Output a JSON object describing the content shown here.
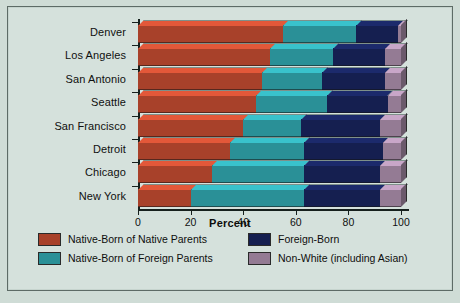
{
  "chart_data": {
    "type": "bar",
    "orientation": "horizontal",
    "stacked": true,
    "title": "",
    "xlabel": "Percent",
    "ylabel": "",
    "xlim": [
      0,
      100
    ],
    "xticks": [
      0,
      20,
      40,
      60,
      80,
      100
    ],
    "xtick_labels": [
      "0",
      "20",
      "40",
      "60",
      "80",
      "100"
    ],
    "grid": false,
    "legend_position": "bottom",
    "categories": [
      "Denver",
      "Los Angeles",
      "San Antonio",
      "Seattle",
      "San Francisco",
      "Detroit",
      "Chicago",
      "New York"
    ],
    "series": [
      {
        "name": "Native-Born of Native Parents",
        "color": "#a8412a",
        "values": [
          55,
          50,
          47,
          45,
          40,
          35,
          28,
          20
        ]
      },
      {
        "name": "Native-Born of Foreign Parents",
        "color": "#2a9097",
        "values": [
          28,
          24,
          23,
          27,
          22,
          28,
          35,
          43
        ]
      },
      {
        "name": "Foreign-Born",
        "color": "#151f50",
        "values": [
          16,
          20,
          24,
          23,
          30,
          30,
          29,
          29
        ]
      },
      {
        "name": "Non-White (including Asian)",
        "color": "#947b94",
        "values": [
          1,
          6,
          6,
          5,
          8,
          7,
          8,
          8
        ]
      }
    ]
  },
  "legend": {
    "items": [
      {
        "label": "Native-Born of Native Parents",
        "color": "#a8412a"
      },
      {
        "label": "Foreign-Born",
        "color": "#151f50"
      },
      {
        "label": "Native-Born of Foreign Parents",
        "color": "#2a9097"
      },
      {
        "label": "Non-White (including Asian)",
        "color": "#947b94"
      }
    ]
  },
  "axis": {
    "x_title": "Percent"
  },
  "caption": {
    "text": ""
  },
  "colors": {
    "panel_background": "#d5e1dc",
    "page_background": "#cfdcd6",
    "border": "#5d6b66",
    "text": "#10100f"
  }
}
